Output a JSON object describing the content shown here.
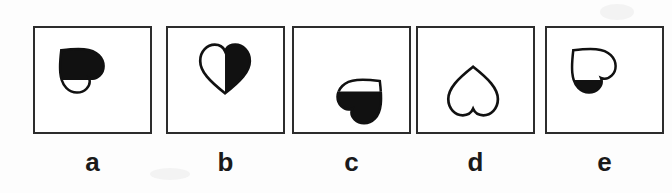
{
  "figure": {
    "type": "multiple-choice-figure",
    "background_color": "#ffffff",
    "ink_color": "#1a1a1a",
    "box_border_color": "#2c2c2c",
    "options": [
      {
        "label": "a",
        "shape": "heart",
        "rotation_deg": 135,
        "fill_pattern": "top-half-black",
        "top_fill": "#111111",
        "bottom_fill": "#ffffff",
        "outline": "#111111",
        "position_in_box": "upper-left"
      },
      {
        "label": "b",
        "shape": "heart",
        "rotation_deg": 0,
        "fill_pattern": "right-half-black",
        "left_fill": "#ffffff",
        "right_fill": "#111111",
        "outline": "#111111",
        "position_in_box": "center-upper"
      },
      {
        "label": "c",
        "shape": "heart",
        "rotation_deg": -135,
        "fill_pattern": "bottom-half-black",
        "top_fill": "#ffffff",
        "bottom_fill": "#111111",
        "outline": "#111111",
        "position_in_box": "lower-right"
      },
      {
        "label": "d",
        "shape": "heart",
        "rotation_deg": 180,
        "fill_pattern": "all-white",
        "top_fill": "#ffffff",
        "bottom_fill": "#ffffff",
        "outline": "#111111",
        "position_in_box": "center-lower"
      },
      {
        "label": "e",
        "shape": "heart",
        "rotation_deg": 135,
        "fill_pattern": "bottom-half-black",
        "top_fill": "#ffffff",
        "bottom_fill": "#111111",
        "outline": "#111111",
        "position_in_box": "upper-left"
      }
    ]
  }
}
